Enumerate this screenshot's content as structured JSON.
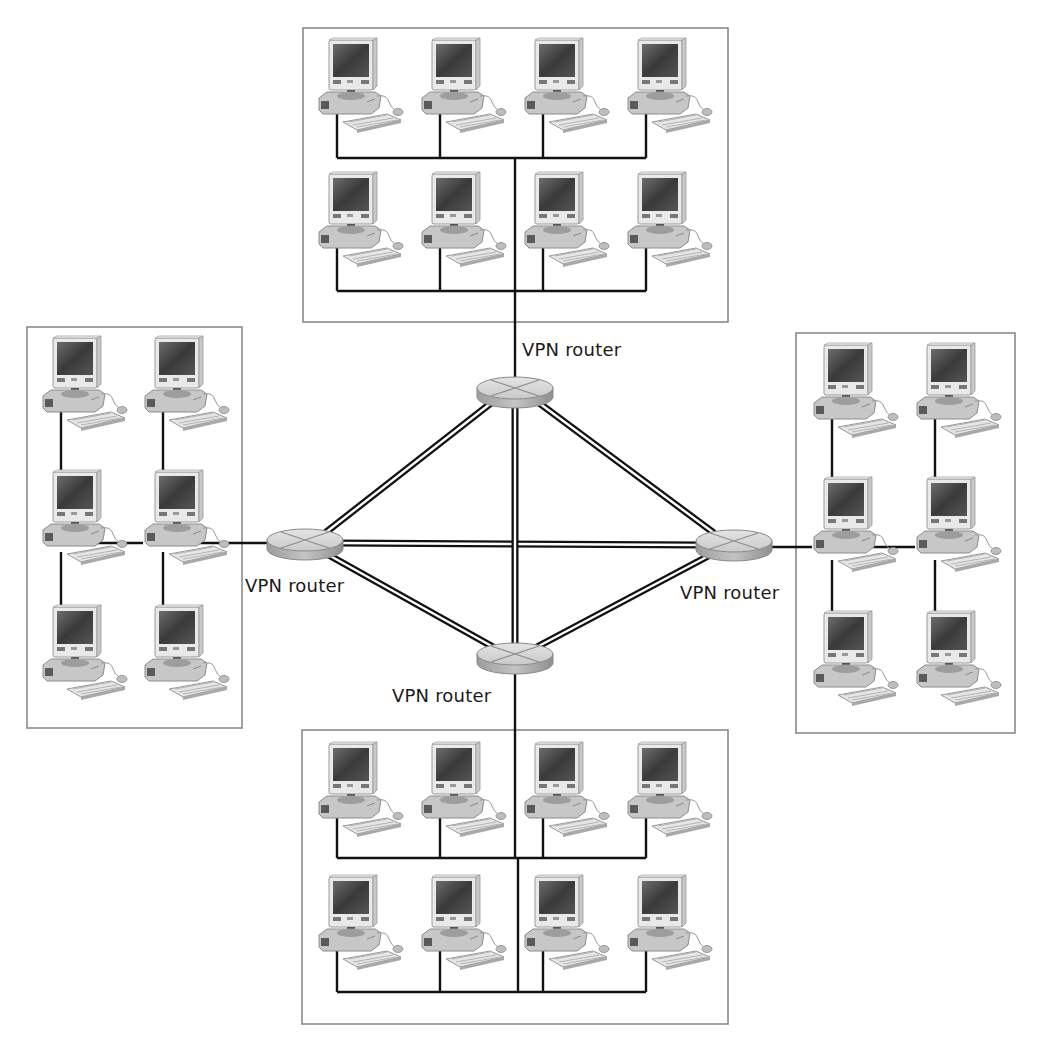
{
  "diagram": {
    "title": "",
    "router_label": "VPN router",
    "colors": {
      "background": "#ffffff",
      "box_border": "#8a8a8a",
      "wire": "#111111",
      "router_top": "#d9d9d9",
      "router_side": "#a8a8a8",
      "label_text": "#1a1a1a"
    },
    "routers": [
      {
        "id": "router-top",
        "label": "VPN router",
        "cx": 515,
        "cy": 390
      },
      {
        "id": "router-left",
        "label": "VPN router",
        "cx": 305,
        "cy": 543
      },
      {
        "id": "router-right",
        "label": "VPN router",
        "cx": 734,
        "cy": 543
      },
      {
        "id": "router-bottom",
        "label": "VPN router",
        "cx": 515,
        "cy": 657
      }
    ],
    "labels": [
      {
        "router": "router-top",
        "text": "VPN router"
      },
      {
        "router": "router-left",
        "text": "VPN router"
      },
      {
        "router": "router-right",
        "text": "VPN router"
      },
      {
        "router": "router-bottom",
        "text": "VPN router"
      }
    ],
    "tunnels": [
      [
        "router-top",
        "router-left"
      ],
      [
        "router-top",
        "router-right"
      ],
      [
        "router-top",
        "router-bottom"
      ],
      [
        "router-left",
        "router-right"
      ],
      [
        "router-left",
        "router-bottom"
      ],
      [
        "router-right",
        "router-bottom"
      ]
    ],
    "lans": [
      {
        "id": "lan-top",
        "computers": 8,
        "layout": "2 rows x 4"
      },
      {
        "id": "lan-left",
        "computers": 6,
        "layout": "3 rows x 2"
      },
      {
        "id": "lan-right",
        "computers": 6,
        "layout": "3 rows x 2"
      },
      {
        "id": "lan-bottom",
        "computers": 8,
        "layout": "2 rows x 4"
      }
    ],
    "icons": {
      "router": "vpn-router-icon",
      "computer": "desktop-computer-icon"
    }
  }
}
